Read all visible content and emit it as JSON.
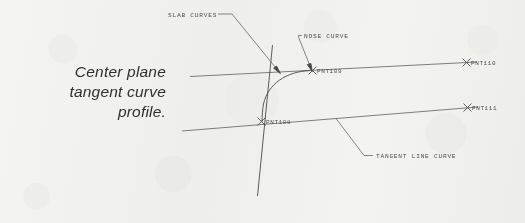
{
  "canvas": {
    "width": 525,
    "height": 223,
    "background": "#f8f8f6",
    "ink": "#4d4d52"
  },
  "caption": {
    "text": "Center plane\ntangent curve\nprofile."
  },
  "annotations": {
    "slab_curves": "SLAB CURVES",
    "nose_curve": "NOSE CURVE",
    "tangent_line_curve": "TANGENT LINE CURVE"
  },
  "points": [
    {
      "id": "pnt109",
      "label": "PNT109",
      "x": 313,
      "y": 70
    },
    {
      "id": "pnt110",
      "label": "PNT110",
      "x": 470,
      "y": 62
    },
    {
      "id": "pnt108",
      "label": "PNT108",
      "x": 263,
      "y": 122
    },
    {
      "id": "pnt111",
      "label": "PNT111",
      "x": 471,
      "y": 107
    }
  ],
  "geometry": {
    "type": "engineering-line-drawing",
    "description": "Center plane tangent curve profile with slab curves, nose curve and tangent line curve",
    "upper_line": {
      "from": [
        190,
        76
      ],
      "to": [
        477,
        62
      ]
    },
    "lower_line": {
      "from": [
        182,
        131
      ],
      "to": [
        478,
        107
      ]
    },
    "slab_curve_vertical": {
      "from": [
        272,
        45
      ],
      "to": [
        258,
        196
      ]
    },
    "nose_curve_arc": {
      "start": [
        310,
        70
      ],
      "control": [
        268,
        74
      ],
      "end": [
        262,
        121
      ]
    },
    "leaders": {
      "slab_curves": {
        "from": [
          231,
          14
        ],
        "to": [
          279,
          72
        ]
      },
      "nose_curve": {
        "from": [
          299,
          35
        ],
        "to": [
          312,
          71
        ]
      },
      "tangent_line_curve": {
        "from": [
          375,
          155
        ],
        "to": [
          337,
          119
        ]
      }
    }
  }
}
